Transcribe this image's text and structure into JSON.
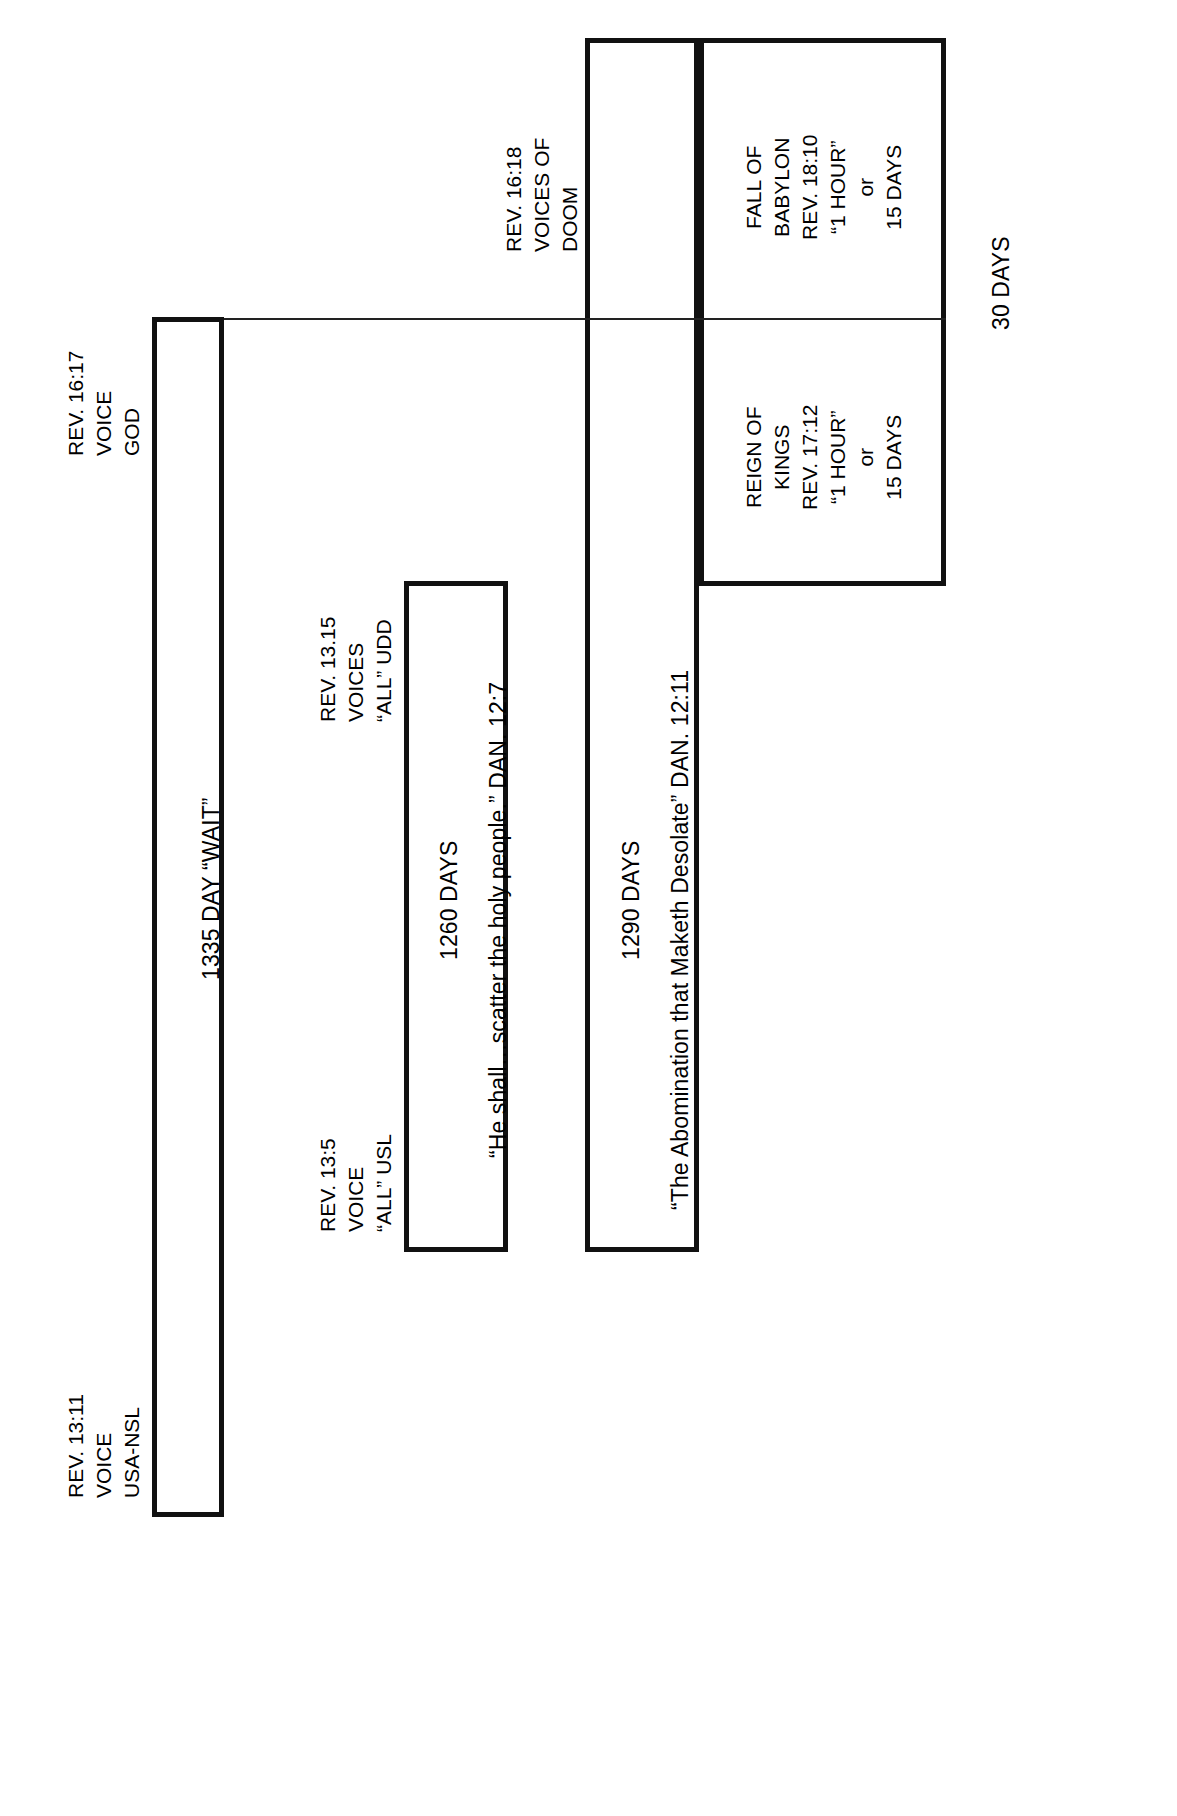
{
  "diagram": {
    "orientation": "rotated-90-ccw",
    "ink_color": "#111111",
    "background": "#ffffff"
  },
  "markers": {
    "usa_nsl": {
      "ref": "REV. 13:11",
      "word": "VOICE",
      "actor": "USA-NSL"
    },
    "all_usl": {
      "ref": "REV. 13:5",
      "word": "VOICE",
      "actor": "“ALL” USL"
    },
    "all_udd": {
      "ref": "REV. 13.15",
      "word": "VOICES",
      "actor": "“ALL” UDD"
    },
    "voice_god": {
      "ref": "REV. 16:17",
      "word": "VOICE",
      "actor": "GOD"
    },
    "voices_doom": {
      "ref": "REV. 16:18",
      "word": "VOICES OF",
      "actor": "DOOM"
    }
  },
  "bars": {
    "wait_1335": {
      "label": "1335 DAY “WAIT”"
    },
    "days_1260": {
      "count": "1260 DAYS",
      "quote": "“He shall…scatter the holy people.” DAN. 12:7"
    },
    "days_1290": {
      "count": "1290 DAYS",
      "quote": "“The Abomination that Maketh Desolate” DAN. 12:11"
    }
  },
  "panels": {
    "reign_of_kings": {
      "line1": "REIGN OF",
      "line2": "KINGS",
      "line3": "REV. 17:12",
      "line4": "“1 HOUR”",
      "line5": "or",
      "line6": "15 DAYS"
    },
    "fall_of_babylon": {
      "line1": "FALL OF",
      "line2": "BABYLON",
      "line3": "REV. 18:10",
      "line4": "“1 HOUR”",
      "line5": "or",
      "line6": "15 DAYS"
    }
  },
  "totals": {
    "thirty_days": "30 DAYS"
  }
}
